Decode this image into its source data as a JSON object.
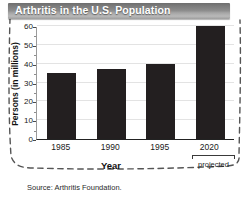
{
  "title": "Arthritis in the U.S. Population",
  "source_note": "Source: Arthritis Foundation.",
  "projected_note": "projected",
  "colors": {
    "bar": "#231f20",
    "titlebar_dark": "#6e6e6e",
    "titlebar_light": "#b9b9b9",
    "gridline": "#e3e3e3",
    "axis": "#222222",
    "dashed_border": "#555555"
  },
  "chart_data": {
    "type": "bar",
    "title": "Arthritis in the U.S. Population",
    "xlabel": "Year",
    "ylabel": "Persons (in millions)",
    "categories": [
      "1985",
      "1990",
      "1995",
      "2020"
    ],
    "values": [
      35,
      37,
      40,
      60
    ],
    "ylim": [
      0,
      60
    ],
    "yticks": [
      0,
      10,
      20,
      30,
      40,
      50,
      60
    ],
    "ytick_labels": [
      "0",
      "10",
      "20",
      "30",
      "40",
      "50",
      "60"
    ],
    "minor_ytick_step": 5,
    "grid": true,
    "legend": "none",
    "annotations": [
      {
        "category": "2020",
        "text": "projected"
      }
    ],
    "source": "Source: Arthritis Foundation."
  }
}
